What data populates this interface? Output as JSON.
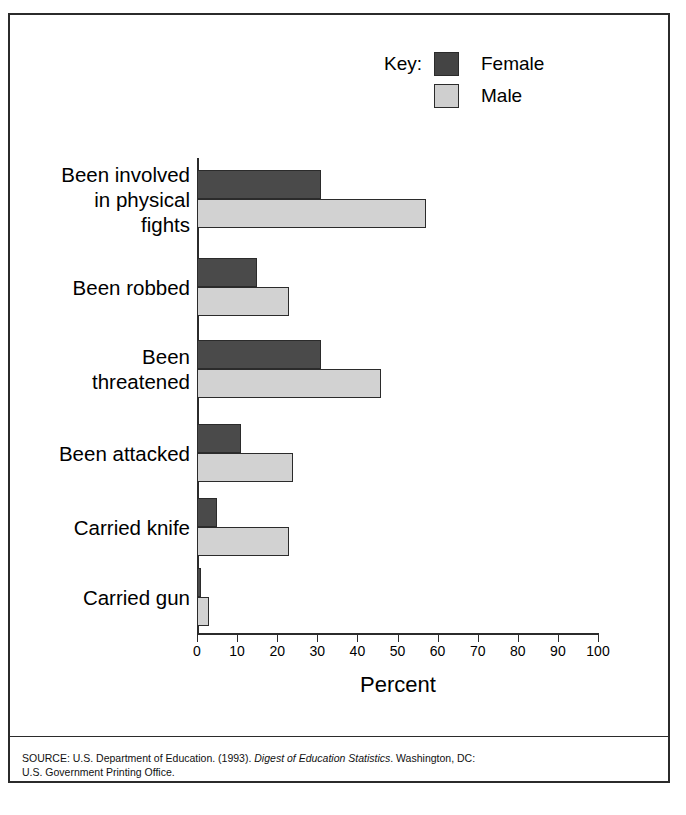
{
  "title": "Violence at School: 8th Grade",
  "legend": {
    "key_label": "Key:",
    "entries": [
      {
        "label": "Female",
        "color": "#4a4a4a",
        "swatch": "legend-swatch-female"
      },
      {
        "label": "Male",
        "color": "#d2d2d2",
        "swatch": "legend-swatch-male"
      }
    ]
  },
  "axis": {
    "x_title": "Percent",
    "tick_labels": [
      "0",
      "10",
      "20",
      "30",
      "40",
      "50",
      "60",
      "70",
      "80",
      "90",
      "100"
    ]
  },
  "source": {
    "line1_prefix": "SOURCE: U.S. Department of Education. (1993). ",
    "line1_italic": "Digest of Education Statistics",
    "line1_suffix": ". Washington, DC:",
    "line2": "U.S. Government Printing Office."
  },
  "chart_data": {
    "type": "bar",
    "orientation": "horizontal",
    "title": "Violence at School: 8th Grade",
    "xlabel": "Percent",
    "ylabel": "",
    "xlim": [
      0,
      100
    ],
    "xticks": [
      0,
      10,
      20,
      30,
      40,
      50,
      60,
      70,
      80,
      90,
      100
    ],
    "grid": false,
    "legend_position": "top-right",
    "categories": [
      "Been involved in physical fights",
      "Been robbed",
      "Been threatened",
      "Been attacked",
      "Carried knife",
      "Carried gun"
    ],
    "category_label_lines": [
      [
        "Been involved",
        "in physical",
        "fights"
      ],
      [
        "Been robbed"
      ],
      [
        "Been",
        "threatened"
      ],
      [
        "Been attacked"
      ],
      [
        "Carried knife"
      ],
      [
        "Carried gun"
      ]
    ],
    "series": [
      {
        "name": "Female",
        "color": "#4a4a4a",
        "values": [
          31,
          15,
          31,
          11,
          5,
          1
        ]
      },
      {
        "name": "Male",
        "color": "#d2d2d2",
        "values": [
          57,
          23,
          46,
          24,
          23,
          3
        ]
      }
    ]
  }
}
